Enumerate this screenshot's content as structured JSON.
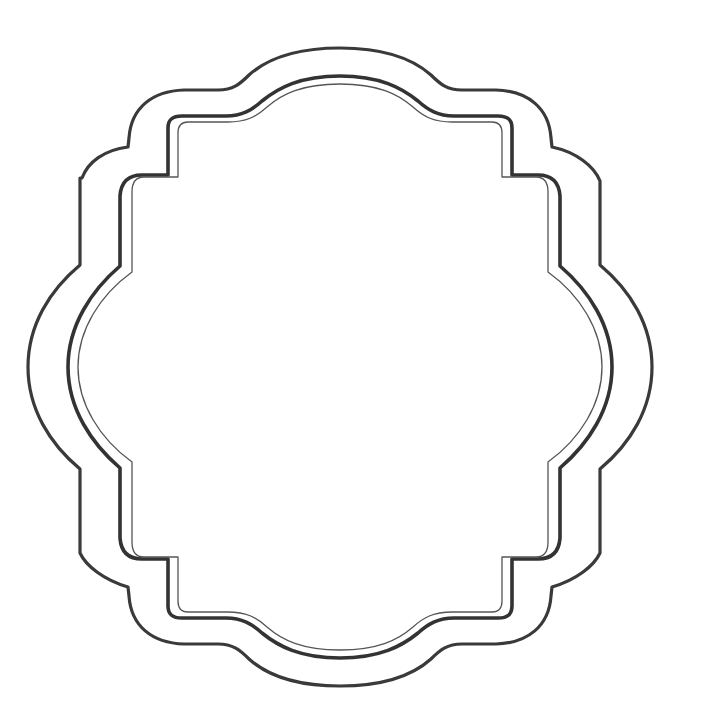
{
  "image": {
    "title": "Decorative scalloped frame outline",
    "description": "Blank ornamental label/badge frame with three nested outlines on white background",
    "background_color": "#ffffff",
    "line_color": "#333333",
    "center": [
      340,
      367
    ],
    "layers": [
      {
        "name": "outer-border",
        "style": "thick",
        "top_y": 48,
        "left_x": 28
      },
      {
        "name": "middle-border",
        "style": "thick",
        "top_y": 76,
        "left_x": 68
      },
      {
        "name": "inner-border",
        "style": "thin",
        "top_y": 84,
        "left_x": 78
      }
    ]
  }
}
